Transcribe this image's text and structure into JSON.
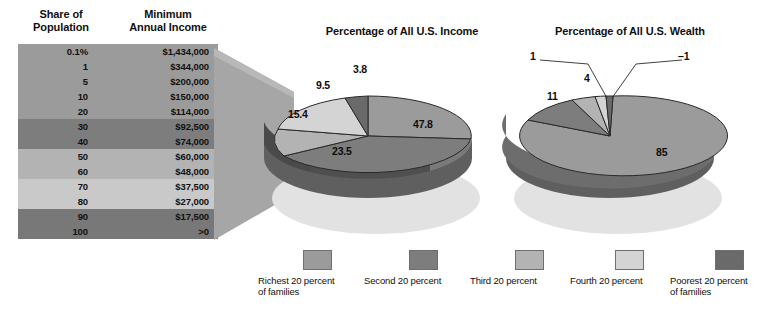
{
  "table": {
    "header_share": "Share of\nPopulation",
    "header_income": "Minimum\nAnnual Income",
    "rows": [
      {
        "share": "0.1%",
        "income": "$1,434,000",
        "color": "#9b9b9b"
      },
      {
        "share": "1",
        "income": "$344,000",
        "color": "#9b9b9b"
      },
      {
        "share": "5",
        "income": "$200,000",
        "color": "#9b9b9b"
      },
      {
        "share": "10",
        "income": "$150,000",
        "color": "#9b9b9b"
      },
      {
        "share": "20",
        "income": "$114,000",
        "color": "#9b9b9b"
      },
      {
        "share": "30",
        "income": "$92,500",
        "color": "#7d7d7d"
      },
      {
        "share": "40",
        "income": "$74,000",
        "color": "#7d7d7d"
      },
      {
        "share": "50",
        "income": "$60,000",
        "color": "#b3b3b3"
      },
      {
        "share": "60",
        "income": "$48,000",
        "color": "#b3b3b3"
      },
      {
        "share": "70",
        "income": "$37,500",
        "color": "#c9c9c9"
      },
      {
        "share": "80",
        "income": "$27,000",
        "color": "#c9c9c9"
      },
      {
        "share": "90",
        "income": "$17,500",
        "color": "#787878"
      },
      {
        "share": "100",
        "income": ">0",
        "color": "#787878"
      }
    ]
  },
  "chart_data": [
    {
      "type": "pie",
      "title": "Percentage of All U.S. Income",
      "categories": [
        "Richest 20 percent of families",
        "Second 20 percent",
        "Third 20 percent",
        "Fourth 20 percent",
        "Poorest 20 percent of families"
      ],
      "values": [
        47.8,
        23.5,
        15.4,
        9.5,
        3.8
      ],
      "labels": [
        "47.8",
        "23.5",
        "15.4",
        "9.5",
        "3.8"
      ],
      "colors": [
        "#9b9b9b",
        "#7d7d7d",
        "#b3b3b3",
        "#d4d4d4",
        "#6a6a6a"
      ],
      "legend_position": "bottom"
    },
    {
      "type": "pie",
      "title": "Percentage of All U.S. Wealth",
      "categories": [
        "Richest 20 percent of families",
        "Second 20 percent",
        "Third 20 percent",
        "Fourth 20 percent",
        "Poorest 20 percent of families"
      ],
      "values": [
        85,
        11,
        4,
        1,
        -1
      ],
      "labels": [
        "85",
        "11",
        "4",
        "1",
        "–1"
      ],
      "colors": [
        "#9b9b9b",
        "#7d7d7d",
        "#b3b3b3",
        "#d4d4d4",
        "#6a6a6a"
      ],
      "legend_position": "bottom"
    }
  ],
  "legend": {
    "items": [
      {
        "label": "Richest 20 percent\nof families",
        "color": "#9b9b9b"
      },
      {
        "label": "Second 20 percent",
        "color": "#7d7d7d"
      },
      {
        "label": "Third 20 percent",
        "color": "#b3b3b3"
      },
      {
        "label": "Fourth 20 percent",
        "color": "#d4d4d4"
      },
      {
        "label": "Poorest 20 percent\nof families",
        "color": "#6a6a6a"
      }
    ]
  }
}
